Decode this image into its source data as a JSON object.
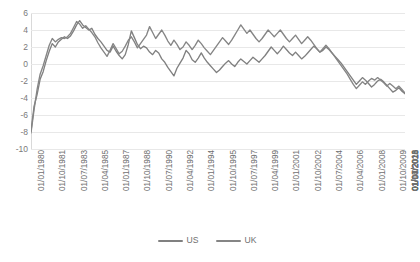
{
  "chart_data": {
    "type": "line",
    "title": "",
    "subtitle": "",
    "xlabel": "",
    "ylabel": "",
    "ylim": [
      -10,
      6
    ],
    "ytick_values": [
      6,
      4,
      2,
      0,
      -2,
      -4,
      -6,
      -8,
      -10
    ],
    "ytick_labels": [
      "6",
      "4",
      "2",
      "0",
      "-2",
      "-4",
      "-6",
      "-8",
      "-10"
    ],
    "grid": true,
    "legend_position": "bottom",
    "x_tick_labels": [
      "01/01/1980",
      "01/10/1981",
      "01/07/1983",
      "01/04/1985",
      "01/01/1987",
      "01/10/1988",
      "01/07/1990",
      "01/04/1992",
      "01/01/1994",
      "01/10/1995",
      "01/07/1997",
      "01/04/1999",
      "01/01/2001",
      "01/10/2002",
      "01/07/2004",
      "01/04/2006",
      "01/01/2008",
      "01/10/2009",
      "01/07/2011",
      "01/04/2013",
      "01/01/2015",
      "01/10/2016",
      "01/07/2018",
      "01/04/2020"
    ],
    "x_tick_step_quarters": 7,
    "series": [
      {
        "name": "US",
        "color": "#808080",
        "values": [
          -7.9,
          -5.0,
          -3.6,
          -1.8,
          -0.9,
          0.4,
          1.5,
          2.4,
          2.0,
          2.6,
          2.9,
          3.2,
          3.0,
          3.3,
          3.9,
          4.6,
          5.1,
          4.6,
          4.3,
          4.0,
          4.2,
          3.5,
          3.0,
          2.6,
          2.1,
          1.6,
          1.4,
          2.1,
          1.5,
          1.0,
          0.6,
          1.1,
          2.3,
          3.9,
          3.1,
          2.3,
          1.8,
          2.1,
          1.9,
          1.4,
          1.1,
          1.6,
          1.3,
          0.6,
          0.2,
          -0.4,
          -0.9,
          -1.4,
          -0.5,
          0.1,
          0.7,
          1.6,
          1.2,
          0.5,
          0.2,
          0.7,
          1.3,
          0.7,
          0.2,
          -0.2,
          -0.6,
          -1.0,
          -0.7,
          -0.3,
          0.1,
          0.4,
          0.0,
          -0.3,
          0.2,
          0.6,
          0.3,
          0.0,
          0.4,
          0.8,
          0.5,
          0.2,
          0.6,
          1.0,
          1.5,
          2.0,
          1.6,
          1.2,
          1.6,
          2.1,
          1.7,
          1.3,
          1.0,
          1.4,
          1.0,
          0.6,
          0.9,
          1.3,
          1.7,
          2.1,
          1.8,
          1.4,
          1.6,
          2.0,
          1.7,
          1.3,
          0.9,
          0.5,
          0.1,
          -0.4,
          -0.9,
          -1.4,
          -1.9,
          -2.4,
          -2.0,
          -1.6,
          -1.9,
          -2.3,
          -2.7,
          -2.4,
          -2.0,
          -1.8,
          -2.1,
          -2.5,
          -2.9,
          -3.3,
          -3.1,
          -2.8,
          -3.2,
          -3.5
        ]
      },
      {
        "name": "UK",
        "color": "#858585",
        "values": [
          -8.1,
          -5.4,
          -3.0,
          -1.2,
          -0.2,
          1.0,
          2.2,
          3.0,
          2.6,
          2.9,
          3.1,
          3.0,
          3.2,
          3.6,
          4.3,
          5.0,
          4.7,
          4.2,
          4.5,
          4.1,
          3.7,
          3.2,
          2.5,
          1.9,
          1.4,
          0.9,
          1.6,
          2.4,
          1.8,
          1.2,
          1.5,
          2.1,
          2.8,
          3.2,
          2.6,
          1.9,
          2.4,
          2.9,
          3.4,
          4.4,
          3.7,
          3.0,
          3.5,
          4.0,
          3.4,
          2.7,
          2.2,
          2.8,
          2.3,
          1.7,
          2.0,
          2.6,
          2.2,
          1.7,
          2.2,
          2.8,
          2.4,
          1.9,
          1.5,
          1.1,
          1.6,
          2.1,
          2.6,
          3.1,
          2.7,
          2.3,
          2.8,
          3.4,
          4.0,
          4.6,
          4.1,
          3.6,
          4.0,
          3.5,
          3.0,
          2.6,
          3.0,
          3.5,
          4.0,
          3.6,
          3.2,
          3.6,
          4.0,
          3.5,
          3.0,
          2.6,
          3.0,
          3.4,
          2.9,
          2.4,
          2.8,
          3.2,
          2.8,
          2.3,
          1.8,
          1.4,
          1.8,
          2.2,
          1.8,
          1.3,
          0.8,
          0.3,
          -0.2,
          -0.7,
          -1.2,
          -1.8,
          -2.4,
          -2.9,
          -2.5,
          -2.1,
          -2.4,
          -2.0,
          -1.7,
          -1.9,
          -1.6,
          -1.9,
          -2.2,
          -2.6,
          -2.3,
          -2.6,
          -2.9,
          -2.6,
          -3.0,
          -3.4
        ]
      }
    ]
  },
  "legend": {
    "items": [
      {
        "label": "US"
      },
      {
        "label": "UK"
      }
    ]
  },
  "colors": {
    "series_us": "#808080",
    "series_uk": "#858585",
    "gridline": "#e8e8e8",
    "tick_text": "#6f6f6f"
  }
}
